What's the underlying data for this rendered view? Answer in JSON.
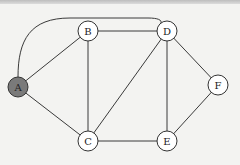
{
  "graph": {
    "nodes": [
      {
        "id": "A",
        "label": "A",
        "highlighted": true
      },
      {
        "id": "B",
        "label": "B",
        "highlighted": false
      },
      {
        "id": "C",
        "label": "C",
        "highlighted": false
      },
      {
        "id": "D",
        "label": "D",
        "highlighted": false
      },
      {
        "id": "E",
        "label": "E",
        "highlighted": false
      },
      {
        "id": "F",
        "label": "F",
        "highlighted": false
      }
    ],
    "edges": [
      {
        "from": "A",
        "to": "D",
        "curved": true
      },
      {
        "from": "A",
        "to": "B",
        "curved": false
      },
      {
        "from": "A",
        "to": "C",
        "curved": false
      },
      {
        "from": "B",
        "to": "D",
        "curved": false
      },
      {
        "from": "B",
        "to": "C",
        "curved": false
      },
      {
        "from": "D",
        "to": "C",
        "curved": false
      },
      {
        "from": "D",
        "to": "E",
        "curved": false
      },
      {
        "from": "D",
        "to": "F",
        "curved": false
      },
      {
        "from": "C",
        "to": "E",
        "curved": false
      },
      {
        "from": "E",
        "to": "F",
        "curved": false
      }
    ],
    "colors": {
      "highlight_fill": "#7a7a7a",
      "node_fill": "#ffffff",
      "edge": "#3a3a3a"
    }
  }
}
